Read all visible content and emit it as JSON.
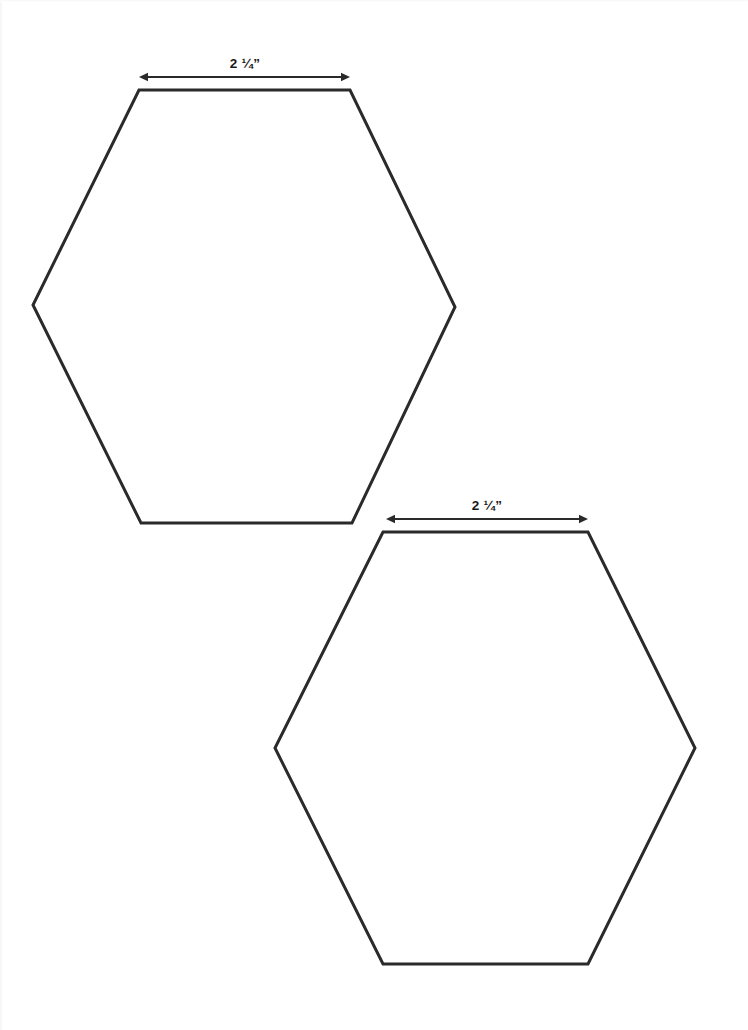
{
  "page": {
    "background_color": "#ffffff",
    "width": 748,
    "height": 1030
  },
  "style": {
    "line_color": "#2a2a2a",
    "line_width": 3,
    "dimension_line_color": "#2a2a2a",
    "dimension_line_width": 2,
    "label_color": "#1a1a1a",
    "shape_fill": "#ffffff"
  },
  "shapes": [
    {
      "id": "hexagon-1",
      "name": "hexagon-top-left",
      "points": "139,90 350,90 455,307 352,523 141,523 33,305",
      "dimension": {
        "label": "2 ¼”",
        "value": "2 1/4",
        "unit": "inch",
        "line_y": 77,
        "x_start": 139,
        "x_end": 350,
        "label_x": 245,
        "label_y": 68
      }
    },
    {
      "id": "hexagon-2",
      "name": "hexagon-bottom-right",
      "points": "383,532 588,532 695,748 588,964 383,964 275,748",
      "dimension": {
        "label": "2 ¼”",
        "value": "2 1/4",
        "unit": "inch",
        "line_y": 519,
        "x_start": 386,
        "x_end": 588,
        "label_x": 487,
        "label_y": 510
      }
    }
  ]
}
